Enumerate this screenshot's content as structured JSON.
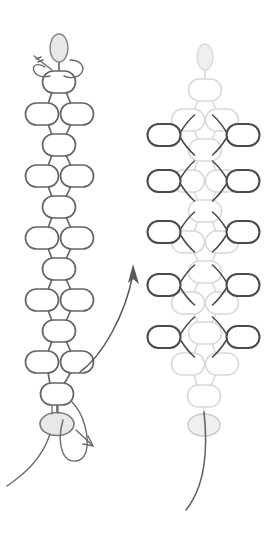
{
  "diagram": {
    "type": "beadwork-pattern-instruction",
    "canvas": {
      "width": 278,
      "height": 533,
      "background": "#ffffff"
    },
    "colors": {
      "base_stroke": "#666666",
      "faded_stroke": "#d8d8d8",
      "new_bead_stroke": "#4a4a4a",
      "thread_stroke": "#6b6b6b",
      "bead_fill": "#ffffff",
      "anchor_bead_fill": "#e8e8e8",
      "anchor_bead_fill_pale": "#efefef",
      "arrow_stroke": "#5a5a5a"
    },
    "stroke_widths": {
      "base_bead": 1.7,
      "faded_bead": 1.5,
      "new_bead": 2.0,
      "thread": 1.4,
      "arrow": 1.5
    },
    "bead_size": {
      "rx": 16.5,
      "ry": 11,
      "corner_radius": 11
    },
    "panels": [
      {
        "id": "panel-left",
        "name": "base-chain-step",
        "center_x": 59,
        "role": "Existing beaded chain with needle and working thread",
        "anchor_bead_top": {
          "name": "top-anchor-bead",
          "cx": 59,
          "cy": 48,
          "rx": 9,
          "ry": 14,
          "orientation": "vertical",
          "fill": "#e8e8e8"
        },
        "anchor_bead_bottom": {
          "name": "bottom-anchor-bead",
          "cx": 57,
          "cy": 424,
          "rx": 17,
          "ry": 11.5,
          "orientation": "horizontal",
          "fill": "#e8e8e8"
        },
        "rows": [
          {
            "type": "single",
            "cy": 82,
            "beads": [
              {
                "cx": 59
              }
            ]
          },
          {
            "type": "pair",
            "cy": 114,
            "beads": [
              {
                "cx": 42
              },
              {
                "cx": 77
              }
            ]
          },
          {
            "type": "single",
            "cy": 145,
            "beads": [
              {
                "cx": 59
              }
            ]
          },
          {
            "type": "pair",
            "cy": 176,
            "beads": [
              {
                "cx": 42
              },
              {
                "cx": 77
              }
            ]
          },
          {
            "type": "single",
            "cy": 207,
            "beads": [
              {
                "cx": 59
              }
            ]
          },
          {
            "type": "pair",
            "cy": 238,
            "beads": [
              {
                "cx": 42
              },
              {
                "cx": 77
              }
            ]
          },
          {
            "type": "single",
            "cy": 269,
            "beads": [
              {
                "cx": 59
              }
            ]
          },
          {
            "type": "pair",
            "cy": 300,
            "beads": [
              {
                "cx": 42
              },
              {
                "cx": 77
              }
            ]
          },
          {
            "type": "single",
            "cy": 331,
            "beads": [
              {
                "cx": 59
              }
            ]
          },
          {
            "type": "pair",
            "cy": 362,
            "beads": [
              {
                "cx": 42
              },
              {
                "cx": 77
              }
            ]
          },
          {
            "type": "single",
            "cy": 394,
            "beads": [
              {
                "cx": 57
              }
            ]
          }
        ],
        "needle_top": {
          "name": "needle-top",
          "description": "Thread tail and needle tip exiting upper-left of top anchor bead"
        },
        "needle_bottom": {
          "name": "needle-bottom",
          "description": "Needle loop to the right of bottom anchor bead with working thread trailing down-left"
        },
        "working_thread": {
          "name": "working-thread-left",
          "description": "Long thread curving down and to the left off bottom anchor bead"
        }
      },
      {
        "id": "panel-right",
        "name": "added-beads-step",
        "center_x": 205,
        "role": "Same chain faded, with new dark edge beads added along both outer sides",
        "anchor_bead_top": {
          "name": "top-anchor-bead",
          "cx": 205,
          "cy": 57,
          "rx": 8,
          "ry": 13,
          "orientation": "vertical",
          "fill": "#efefef"
        },
        "anchor_bead_bottom": {
          "name": "bottom-anchor-bead",
          "cx": 204,
          "cy": 425,
          "rx": 16,
          "ry": 11,
          "orientation": "horizontal",
          "fill": "#ededed"
        },
        "rows": [
          {
            "type": "single",
            "cy": 90,
            "beads": [
              {
                "cx": 205
              }
            ]
          },
          {
            "type": "pair",
            "cy": 120,
            "beads": [
              {
                "cx": 188
              },
              {
                "cx": 222
              }
            ]
          },
          {
            "type": "single",
            "cy": 150,
            "beads": [
              {
                "cx": 205
              }
            ]
          },
          {
            "type": "pair",
            "cy": 181,
            "beads": [
              {
                "cx": 188
              },
              {
                "cx": 222
              }
            ]
          },
          {
            "type": "single",
            "cy": 211,
            "beads": [
              {
                "cx": 205
              }
            ]
          },
          {
            "type": "pair",
            "cy": 242,
            "beads": [
              {
                "cx": 188
              },
              {
                "cx": 222
              }
            ]
          },
          {
            "type": "single",
            "cy": 272,
            "beads": [
              {
                "cx": 205
              }
            ]
          },
          {
            "type": "pair",
            "cy": 303,
            "beads": [
              {
                "cx": 188
              },
              {
                "cx": 222
              }
            ]
          },
          {
            "type": "single",
            "cy": 333,
            "beads": [
              {
                "cx": 205
              }
            ]
          },
          {
            "type": "pair",
            "cy": 364,
            "beads": [
              {
                "cx": 188
              },
              {
                "cx": 222
              }
            ]
          },
          {
            "type": "single",
            "cy": 396,
            "beads": [
              {
                "cx": 204
              }
            ]
          }
        ],
        "new_beads_left": [
          {
            "name": "new-bead-left-1",
            "cx": 164,
            "cy": 135
          },
          {
            "name": "new-bead-left-2",
            "cx": 164,
            "cy": 181
          },
          {
            "name": "new-bead-left-3",
            "cx": 164,
            "cy": 232
          },
          {
            "name": "new-bead-left-4",
            "cx": 164,
            "cy": 285
          },
          {
            "name": "new-bead-left-5",
            "cx": 164,
            "cy": 337
          }
        ],
        "new_beads_right": [
          {
            "name": "new-bead-right-1",
            "cx": 243,
            "cy": 135
          },
          {
            "name": "new-bead-right-2",
            "cx": 243,
            "cy": 181
          },
          {
            "name": "new-bead-right-3",
            "cx": 243,
            "cy": 232
          },
          {
            "name": "new-bead-right-4",
            "cx": 243,
            "cy": 285
          },
          {
            "name": "new-bead-right-5",
            "cx": 243,
            "cy": 337
          }
        ],
        "working_thread": {
          "name": "working-thread-right",
          "description": "Thread curving down and slightly left off bottom anchor bead"
        }
      }
    ],
    "arrow": {
      "name": "progress-arrow",
      "direction": "upward-right",
      "start": {
        "x": 80,
        "y": 372
      },
      "end": {
        "x": 133,
        "y": 268
      },
      "description": "Curved arrow indicating progression from the left step to the right step"
    },
    "labels": []
  }
}
